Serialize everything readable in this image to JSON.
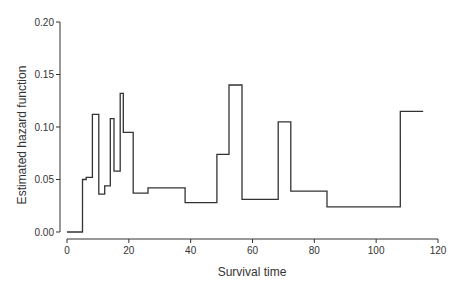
{
  "chart_data": {
    "type": "line",
    "subtype": "step",
    "title": "",
    "xlabel": "Survival time",
    "ylabel": "Estimated hazard function",
    "xlim": [
      0,
      120
    ],
    "ylim": [
      0,
      0.2
    ],
    "x_ticks": [
      0,
      20,
      40,
      60,
      80,
      100,
      120
    ],
    "x_tick_labels": [
      "0",
      "20",
      "40",
      "60",
      "80",
      "100",
      "120"
    ],
    "y_ticks": [
      0,
      0.05,
      0.1,
      0.15,
      0.2
    ],
    "y_tick_labels": [
      "0.00",
      "0.05",
      "0.10",
      "0.15",
      "0.20"
    ],
    "grid": false,
    "legend": null,
    "series": [
      {
        "name": "Estimated hazard",
        "color": "#333333",
        "steps": [
          {
            "x_start": 0.0,
            "x_end": 5.0,
            "y": 0.0
          },
          {
            "x_start": 5.0,
            "x_end": 6.2,
            "y": 0.05
          },
          {
            "x_start": 6.2,
            "x_end": 8.2,
            "y": 0.052
          },
          {
            "x_start": 8.2,
            "x_end": 10.3,
            "y": 0.112
          },
          {
            "x_start": 10.3,
            "x_end": 12.2,
            "y": 0.036
          },
          {
            "x_start": 12.2,
            "x_end": 14.0,
            "y": 0.044
          },
          {
            "x_start": 14.0,
            "x_end": 15.2,
            "y": 0.108
          },
          {
            "x_start": 15.2,
            "x_end": 17.2,
            "y": 0.058
          },
          {
            "x_start": 17.2,
            "x_end": 18.2,
            "y": 0.132
          },
          {
            "x_start": 18.2,
            "x_end": 21.4,
            "y": 0.095
          },
          {
            "x_start": 21.4,
            "x_end": 26.2,
            "y": 0.037
          },
          {
            "x_start": 26.2,
            "x_end": 38.2,
            "y": 0.042
          },
          {
            "x_start": 38.2,
            "x_end": 48.5,
            "y": 0.028
          },
          {
            "x_start": 48.5,
            "x_end": 52.4,
            "y": 0.074
          },
          {
            "x_start": 52.4,
            "x_end": 56.6,
            "y": 0.14
          },
          {
            "x_start": 56.6,
            "x_end": 68.3,
            "y": 0.031
          },
          {
            "x_start": 68.3,
            "x_end": 72.4,
            "y": 0.105
          },
          {
            "x_start": 72.4,
            "x_end": 84.1,
            "y": 0.039
          },
          {
            "x_start": 84.1,
            "x_end": 107.8,
            "y": 0.024
          },
          {
            "x_start": 107.8,
            "x_end": 115.2,
            "y": 0.115
          }
        ]
      }
    ]
  }
}
